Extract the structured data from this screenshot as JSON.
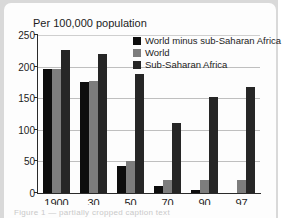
{
  "figure": {
    "background_color": "#d9d9d9",
    "panel_color": "#fdfdfd",
    "caption_ghost": "Figure 1 — partially cropped caption text"
  },
  "chart_data": {
    "type": "bar",
    "title": "Per 100,000 population",
    "subtitle": "",
    "xlabel": "",
    "ylabel": "",
    "ylim": [
      0,
      250
    ],
    "yticks": [
      0,
      50,
      100,
      150,
      200,
      250
    ],
    "ytick_labels": [
      "0",
      "50",
      "100",
      "150",
      "200",
      "250"
    ],
    "grid": true,
    "grid_axis": "y",
    "legend_position": "upper center",
    "categories": [
      "1900",
      "30",
      "50",
      "70",
      "90",
      "97"
    ],
    "series": [
      {
        "name": "World minus sub-Saharan Africa",
        "color": "#0d0d0d",
        "values": [
          196,
          175,
          42,
          11,
          5,
          0
        ]
      },
      {
        "name": "World",
        "color": "#7d7d7d",
        "values": [
          197,
          178,
          51,
          20,
          20,
          21
        ]
      },
      {
        "name": "Sub-Saharan Africa",
        "color": "#262626",
        "values": [
          227,
          220,
          188,
          110,
          152,
          167
        ]
      }
    ]
  }
}
